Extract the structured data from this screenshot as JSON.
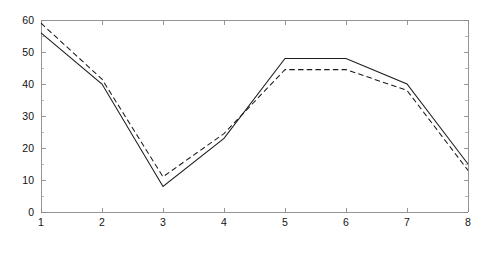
{
  "chart_data": {
    "type": "line",
    "title": "",
    "subtitle": "",
    "xlabel": "",
    "ylabel": "",
    "x": [
      1,
      2,
      3,
      4,
      5,
      6,
      7,
      8
    ],
    "xlim": [
      1,
      8
    ],
    "ylim": [
      0,
      60
    ],
    "grid": false,
    "legend": null,
    "legend_position": "none",
    "x_ticks": [
      "1",
      "2",
      "3",
      "4",
      "5",
      "6",
      "7",
      "8"
    ],
    "x_tick_values": [
      1,
      2,
      3,
      4,
      5,
      6,
      7,
      8
    ],
    "y_ticks": [
      "0",
      "10",
      "20",
      "30",
      "40",
      "50",
      "60"
    ],
    "y_tick_values": [
      0,
      10,
      20,
      30,
      40,
      50,
      60
    ],
    "y_minor_tick_values": [
      5,
      15,
      25,
      35,
      45,
      55
    ],
    "series": [
      {
        "name": "solid",
        "style": "solid",
        "color": "#1b1b1b",
        "values": [
          56,
          40,
          8,
          23,
          48,
          48,
          40,
          15
        ]
      },
      {
        "name": "dashed",
        "style": "dashed",
        "color": "#1b1b1b",
        "values": [
          59,
          41.5,
          11,
          24.5,
          44.5,
          44.5,
          38,
          13
        ]
      }
    ],
    "annotations": []
  },
  "figure": {
    "background_color": "#ffffff",
    "axis_color": "#8a8a8a",
    "plot_left": 41,
    "plot_right": 468,
    "plot_top": 20,
    "plot_bottom": 212
  }
}
